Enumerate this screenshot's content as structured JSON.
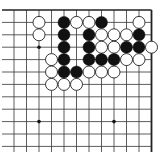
{
  "board": {
    "view": "top-right corner of Go board",
    "columns": 12,
    "rows": 12,
    "origin_x": 14,
    "origin_y": 10,
    "spacing_x": 12.5,
    "spacing_y": 12.4,
    "line_end_y": 152,
    "right_edge_col": 11,
    "top_edge_row": 0,
    "colors": {
      "background": "#ffffff",
      "line": "#333333",
      "edge": "#222222",
      "black_stone": "#111111",
      "white_stone_fill": "#ffffff",
      "white_stone_stroke": "#222222",
      "star_point": "#111111"
    },
    "star_points": [
      {
        "col": 2,
        "row": 3
      },
      {
        "col": 2,
        "row": 9
      },
      {
        "col": 8,
        "row": 9
      }
    ],
    "stones": [
      {
        "color": "white",
        "col": 2,
        "row": 1
      },
      {
        "color": "black",
        "col": 4,
        "row": 1
      },
      {
        "color": "white",
        "col": 5,
        "row": 1
      },
      {
        "color": "white",
        "col": 6,
        "row": 1
      },
      {
        "color": "black",
        "col": 7,
        "row": 1
      },
      {
        "color": "white",
        "col": 10,
        "row": 1
      },
      {
        "color": "white",
        "col": 2,
        "row": 2
      },
      {
        "color": "black",
        "col": 4,
        "row": 2
      },
      {
        "color": "black",
        "col": 6,
        "row": 2
      },
      {
        "color": "white",
        "col": 7,
        "row": 2
      },
      {
        "color": "white",
        "col": 8,
        "row": 2
      },
      {
        "color": "white",
        "col": 9,
        "row": 2
      },
      {
        "color": "black",
        "col": 10,
        "row": 2
      },
      {
        "color": "black",
        "col": 4,
        "row": 3
      },
      {
        "color": "black",
        "col": 6,
        "row": 3
      },
      {
        "color": "white",
        "col": 7,
        "row": 3
      },
      {
        "color": "white",
        "col": 8,
        "row": 3
      },
      {
        "color": "black",
        "col": 9,
        "row": 3
      },
      {
        "color": "black",
        "col": 10,
        "row": 3
      },
      {
        "color": "white",
        "col": 11,
        "row": 3
      },
      {
        "color": "white",
        "col": 3,
        "row": 4
      },
      {
        "color": "black",
        "col": 4,
        "row": 4
      },
      {
        "color": "black",
        "col": 6,
        "row": 4
      },
      {
        "color": "black",
        "col": 7,
        "row": 4
      },
      {
        "color": "black",
        "col": 8,
        "row": 4
      },
      {
        "color": "white",
        "col": 9,
        "row": 4
      },
      {
        "color": "white",
        "col": 10,
        "row": 4
      },
      {
        "color": "white",
        "col": 3,
        "row": 5
      },
      {
        "color": "black",
        "col": 4,
        "row": 5
      },
      {
        "color": "black",
        "col": 5,
        "row": 5
      },
      {
        "color": "white",
        "col": 6,
        "row": 5
      },
      {
        "color": "white",
        "col": 7,
        "row": 5
      },
      {
        "color": "white",
        "col": 8,
        "row": 5
      },
      {
        "color": "white",
        "col": 3,
        "row": 6
      },
      {
        "color": "white",
        "col": 4,
        "row": 6
      },
      {
        "color": "white",
        "col": 5,
        "row": 6
      }
    ]
  }
}
